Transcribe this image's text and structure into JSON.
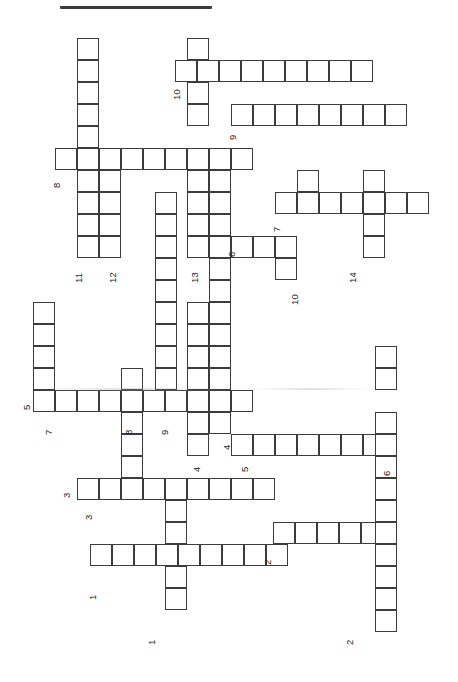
{
  "page": {
    "width": 458,
    "height": 682,
    "background": "#ffffff",
    "ink_color": "#3c3c3c",
    "text_color": "#262626",
    "orientation": "rotated-90-ccw",
    "title": ""
  },
  "top_rule": {
    "x": 60,
    "y": 6,
    "width": 152,
    "height": 3,
    "color": "#3a3a3a"
  },
  "grid": {
    "cell_size": 22,
    "origin_x": 11,
    "origin_y": 38,
    "stroke": 1.6,
    "stroke_color": "#3c3c3c",
    "fill": "#ffffff"
  },
  "crossword": {
    "type": "blank-grid",
    "numbers_visible": [
      1,
      1,
      2,
      2,
      3,
      3,
      4,
      4,
      5,
      5,
      6,
      6,
      7,
      7,
      8,
      8,
      9,
      9,
      10,
      10,
      11,
      12,
      13,
      14
    ],
    "entries": [
      {
        "id": "a-10",
        "number": "10",
        "dir": "across",
        "col": 8,
        "row": 2,
        "length": 9
      },
      {
        "id": "a-9",
        "number": "9",
        "dir": "across",
        "col": 11,
        "row": 5,
        "length": 8
      },
      {
        "id": "a-8",
        "number": "8",
        "dir": "across",
        "col": 2,
        "row": 6,
        "length": 9
      },
      {
        "id": "a-7",
        "number": "7",
        "dir": "across",
        "col": 12,
        "row": 8,
        "length": 7
      },
      {
        "id": "a-6",
        "number": "6",
        "dir": "across",
        "col": 10,
        "row": 10,
        "length": 4
      },
      {
        "id": "a-5t",
        "number": "5",
        "dir": "across",
        "col": 1,
        "row": 16,
        "length": 10
      },
      {
        "id": "a-5b",
        "number": "5",
        "dir": "across",
        "col": 10,
        "row": 18,
        "length": 8
      },
      {
        "id": "a-3",
        "number": "3",
        "dir": "across",
        "col": 3,
        "row": 20,
        "length": 9
      },
      {
        "id": "a-2",
        "number": "2",
        "dir": "across",
        "col": 12,
        "row": 22,
        "length": 6
      },
      {
        "id": "a-1",
        "number": "1",
        "dir": "across",
        "col": 4,
        "row": 24,
        "length": 9
      }
    ],
    "down_entries": [
      {
        "id": "d-11",
        "number": "11",
        "dir": "down",
        "col": 3,
        "row": 1,
        "length": 10
      },
      {
        "id": "d-12",
        "number": "12",
        "dir": "down",
        "col": 5,
        "row": 5,
        "length": 6
      },
      {
        "id": "d-13",
        "number": "13",
        "dir": "down",
        "col": 8,
        "row": 1,
        "length": 11
      },
      {
        "id": "d-14",
        "number": "14",
        "dir": "down",
        "col": 16,
        "row": 5,
        "length": 5
      },
      {
        "id": "d-10",
        "number": "10",
        "dir": "down",
        "col": 13,
        "row": 8,
        "length": 4
      },
      {
        "id": "d-7",
        "number": "7",
        "dir": "down",
        "col": 1,
        "row": 13,
        "length": 5
      },
      {
        "id": "d-8",
        "number": "8",
        "dir": "down",
        "col": 6,
        "row": 12,
        "length": 6
      },
      {
        "id": "d-9",
        "number": "9",
        "dir": "down",
        "col": 7,
        "row": 8,
        "length": 10
      },
      {
        "id": "d-4",
        "number": "4",
        "dir": "down",
        "col": 9,
        "row": 14,
        "length": 6
      },
      {
        "id": "d-6",
        "number": "6",
        "dir": "down",
        "col": 17,
        "row": 15,
        "length": 12
      },
      {
        "id": "d-2",
        "number": "2",
        "dir": "down",
        "col": 16,
        "row": 20,
        "length": 8
      },
      {
        "id": "d-1",
        "number": "1",
        "dir": "down",
        "col": 7,
        "row": 19,
        "length": 8
      },
      {
        "id": "d-3",
        "number": "3",
        "dir": "down",
        "col": 3,
        "row": 16,
        "length": 5
      }
    ],
    "cells": [
      [
        77,
        38
      ],
      [
        77,
        60
      ],
      [
        77,
        82
      ],
      [
        77,
        104
      ],
      [
        77,
        126
      ],
      [
        187,
        38
      ],
      [
        187,
        60
      ],
      [
        175,
        60
      ],
      [
        197,
        60
      ],
      [
        219,
        60
      ],
      [
        241,
        60
      ],
      [
        263,
        60
      ],
      [
        285,
        60
      ],
      [
        307,
        60
      ],
      [
        329,
        60
      ],
      [
        351,
        60
      ],
      [
        187,
        82
      ],
      [
        187,
        104
      ],
      [
        231,
        104
      ],
      [
        253,
        104
      ],
      [
        275,
        104
      ],
      [
        297,
        104
      ],
      [
        319,
        104
      ],
      [
        341,
        104
      ],
      [
        363,
        104
      ],
      [
        385,
        104
      ],
      [
        77,
        148
      ],
      [
        99,
        148
      ],
      [
        55,
        148
      ],
      [
        77,
        148
      ],
      [
        99,
        148
      ],
      [
        121,
        148
      ],
      [
        143,
        148
      ],
      [
        165,
        148
      ],
      [
        187,
        148
      ],
      [
        209,
        148
      ],
      [
        231,
        148
      ],
      [
        77,
        170
      ],
      [
        99,
        170
      ],
      [
        187,
        170
      ],
      [
        209,
        170
      ],
      [
        297,
        170
      ],
      [
        363,
        170
      ],
      [
        77,
        192
      ],
      [
        99,
        192
      ],
      [
        155,
        192
      ],
      [
        187,
        192
      ],
      [
        209,
        192
      ],
      [
        297,
        192
      ],
      [
        363,
        192
      ],
      [
        275,
        192
      ],
      [
        297,
        192
      ],
      [
        319,
        192
      ],
      [
        341,
        192
      ],
      [
        363,
        192
      ],
      [
        385,
        192
      ],
      [
        407,
        192
      ],
      [
        77,
        214
      ],
      [
        99,
        214
      ],
      [
        155,
        214
      ],
      [
        187,
        214
      ],
      [
        209,
        214
      ],
      [
        363,
        214
      ],
      [
        77,
        236
      ],
      [
        99,
        236
      ],
      [
        155,
        236
      ],
      [
        187,
        236
      ],
      [
        209,
        236
      ],
      [
        231,
        236
      ],
      [
        253,
        236
      ],
      [
        275,
        236
      ],
      [
        363,
        236
      ],
      [
        155,
        258
      ],
      [
        209,
        258
      ],
      [
        275,
        258
      ],
      [
        155,
        280
      ],
      [
        209,
        280
      ],
      [
        33,
        302
      ],
      [
        155,
        302
      ],
      [
        187,
        302
      ],
      [
        209,
        302
      ],
      [
        33,
        324
      ],
      [
        155,
        324
      ],
      [
        187,
        324
      ],
      [
        209,
        324
      ],
      [
        33,
        346
      ],
      [
        155,
        346
      ],
      [
        187,
        346
      ],
      [
        209,
        346
      ],
      [
        375,
        346
      ],
      [
        33,
        368
      ],
      [
        121,
        368
      ],
      [
        155,
        368
      ],
      [
        187,
        368
      ],
      [
        209,
        368
      ],
      [
        375,
        368
      ],
      [
        33,
        390
      ],
      [
        55,
        390
      ],
      [
        77,
        390
      ],
      [
        99,
        390
      ],
      [
        121,
        390
      ],
      [
        143,
        390
      ],
      [
        165,
        390
      ],
      [
        187,
        390
      ],
      [
        209,
        390
      ],
      [
        231,
        390
      ],
      [
        121,
        412
      ],
      [
        187,
        412
      ],
      [
        209,
        412
      ],
      [
        375,
        412
      ],
      [
        121,
        434
      ],
      [
        187,
        434
      ],
      [
        231,
        434
      ],
      [
        253,
        434
      ],
      [
        275,
        434
      ],
      [
        297,
        434
      ],
      [
        319,
        434
      ],
      [
        341,
        434
      ],
      [
        363,
        434
      ],
      [
        375,
        434
      ],
      [
        121,
        456
      ],
      [
        375,
        456
      ],
      [
        77,
        478
      ],
      [
        99,
        478
      ],
      [
        121,
        478
      ],
      [
        143,
        478
      ],
      [
        165,
        478
      ],
      [
        187,
        478
      ],
      [
        209,
        478
      ],
      [
        231,
        478
      ],
      [
        253,
        478
      ],
      [
        375,
        478
      ],
      [
        165,
        500
      ],
      [
        375,
        500
      ],
      [
        165,
        522
      ],
      [
        273,
        522
      ],
      [
        295,
        522
      ],
      [
        317,
        522
      ],
      [
        339,
        522
      ],
      [
        361,
        522
      ],
      [
        375,
        522
      ],
      [
        90,
        544
      ],
      [
        112,
        544
      ],
      [
        134,
        544
      ],
      [
        156,
        544
      ],
      [
        178,
        544
      ],
      [
        200,
        544
      ],
      [
        222,
        544
      ],
      [
        244,
        544
      ],
      [
        266,
        544
      ],
      [
        375,
        544
      ],
      [
        165,
        566
      ],
      [
        375,
        566
      ],
      [
        165,
        588
      ],
      [
        375,
        588
      ],
      [
        375,
        610
      ]
    ]
  },
  "labels": [
    {
      "text": "10",
      "x": 172,
      "y": 100
    },
    {
      "text": "9",
      "x": 228,
      "y": 140
    },
    {
      "text": "8",
      "x": 52,
      "y": 188
    },
    {
      "text": "7",
      "x": 272,
      "y": 232
    },
    {
      "text": "6",
      "x": 227,
      "y": 257
    },
    {
      "text": "11",
      "x": 74,
      "y": 283
    },
    {
      "text": "12",
      "x": 108,
      "y": 283
    },
    {
      "text": "13",
      "x": 190,
      "y": 283
    },
    {
      "text": "14",
      "x": 348,
      "y": 283
    },
    {
      "text": "10",
      "x": 290,
      "y": 305
    },
    {
      "text": "5",
      "x": 22,
      "y": 410
    },
    {
      "text": "7",
      "x": 44,
      "y": 435
    },
    {
      "text": "8",
      "x": 124,
      "y": 435
    },
    {
      "text": "9",
      "x": 160,
      "y": 435
    },
    {
      "text": "4",
      "x": 192,
      "y": 472
    },
    {
      "text": "4",
      "x": 222,
      "y": 450
    },
    {
      "text": "5",
      "x": 240,
      "y": 472
    },
    {
      "text": "6",
      "x": 382,
      "y": 476
    },
    {
      "text": "3",
      "x": 62,
      "y": 498
    },
    {
      "text": "3",
      "x": 84,
      "y": 520
    },
    {
      "text": "2",
      "x": 263,
      "y": 565
    },
    {
      "text": "1",
      "x": 88,
      "y": 600
    },
    {
      "text": "1",
      "x": 147,
      "y": 645
    },
    {
      "text": "2",
      "x": 345,
      "y": 645
    }
  ],
  "smudges": [
    {
      "x": 35,
      "y": 388,
      "width": 200,
      "height": 3
    },
    {
      "x": 250,
      "y": 388,
      "width": 120,
      "height": 2
    }
  ]
}
